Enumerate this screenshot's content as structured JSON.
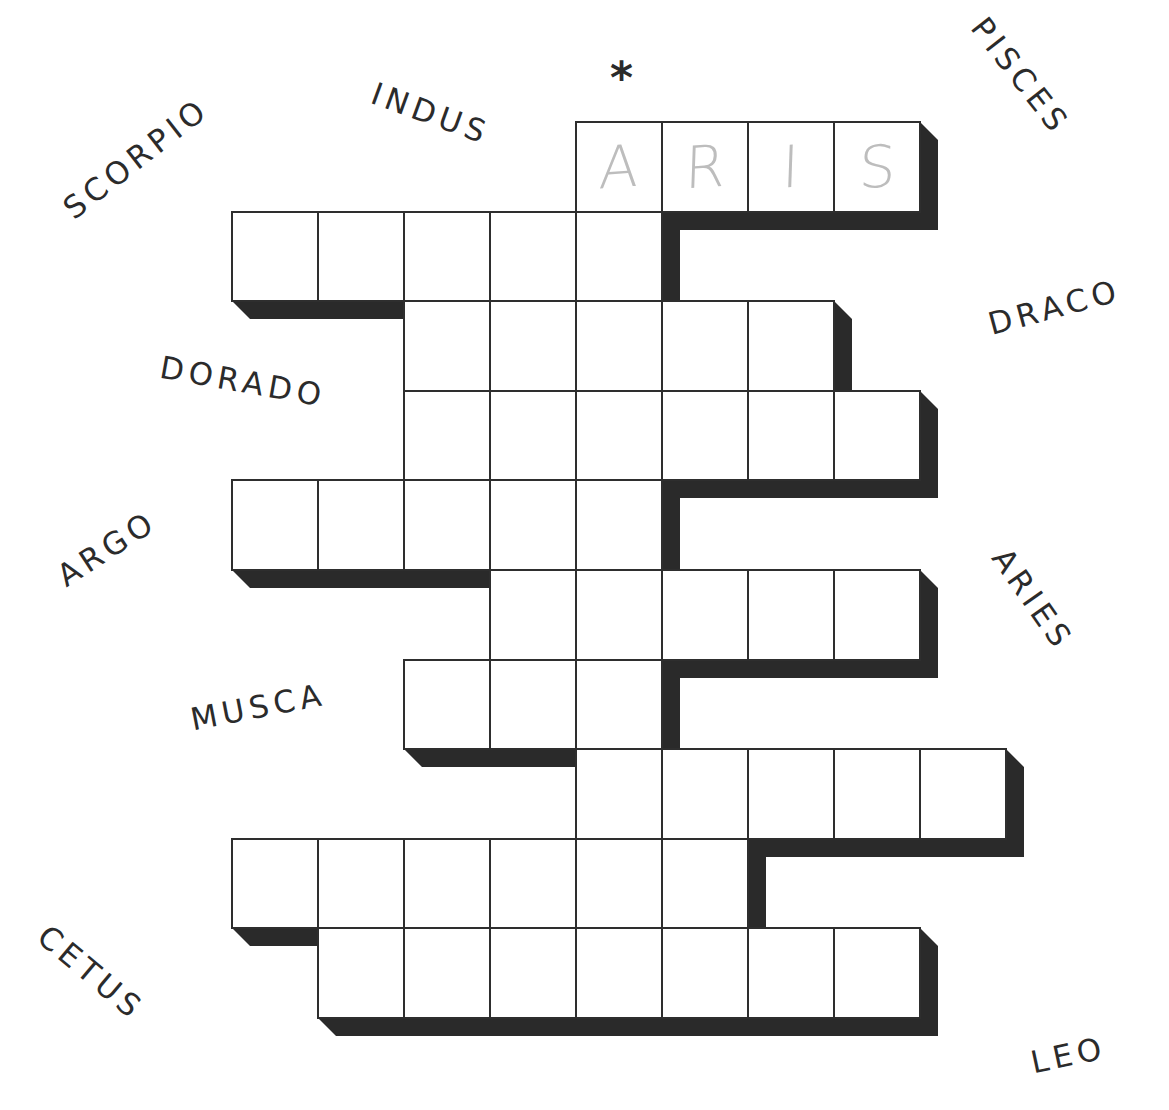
{
  "puzzle": {
    "marker": "*",
    "marker_column": 4,
    "colors": {
      "cell_fill": "#ffffff",
      "cell_border": "#2e2e2e",
      "shadow": "#2a2a2a",
      "label_text": "#2b2b2b",
      "pencil": "#bdbdbd"
    },
    "grid": {
      "origin_x": 232,
      "origin_y": 122,
      "col_pitch": 86,
      "row_pitch": 89.6,
      "shadow_depth": 18,
      "rows": [
        {
          "row": 0,
          "start_col": 4,
          "end_col": 7,
          "letters": [
            "A",
            "R",
            "I",
            "S"
          ]
        },
        {
          "row": 1,
          "start_col": 0,
          "end_col": 4,
          "letters": [
            "",
            "",
            "",
            "",
            ""
          ]
        },
        {
          "row": 2,
          "start_col": 2,
          "end_col": 6,
          "letters": [
            "",
            "",
            "",
            "",
            ""
          ]
        },
        {
          "row": 3,
          "start_col": 2,
          "end_col": 7,
          "letters": [
            "",
            "",
            "",
            "",
            "",
            ""
          ]
        },
        {
          "row": 4,
          "start_col": 0,
          "end_col": 4,
          "letters": [
            "",
            "",
            "",
            "",
            ""
          ]
        },
        {
          "row": 5,
          "start_col": 3,
          "end_col": 7,
          "letters": [
            "",
            "",
            "",
            "",
            ""
          ]
        },
        {
          "row": 6,
          "start_col": 2,
          "end_col": 4,
          "letters": [
            "",
            "",
            ""
          ]
        },
        {
          "row": 7,
          "start_col": 4,
          "end_col": 8,
          "letters": [
            "",
            "",
            "",
            "",
            ""
          ]
        },
        {
          "row": 8,
          "start_col": 0,
          "end_col": 5,
          "letters": [
            "",
            "",
            "",
            "",
            "",
            ""
          ]
        },
        {
          "row": 9,
          "start_col": 1,
          "end_col": 7,
          "letters": [
            "",
            "",
            "",
            "",
            "",
            "",
            ""
          ]
        }
      ]
    },
    "labels": [
      {
        "text": "SCORPIO",
        "x": 58,
        "y": 200,
        "rotate": -38
      },
      {
        "text": "INDUS",
        "x": 378,
        "y": 78,
        "rotate": 20
      },
      {
        "text": "PISCES",
        "x": 990,
        "y": 12,
        "rotate": 52
      },
      {
        "text": "DRACO",
        "x": 985,
        "y": 310,
        "rotate": -15
      },
      {
        "text": "DORADO",
        "x": 163,
        "y": 352,
        "rotate": 10
      },
      {
        "text": "ARGO",
        "x": 52,
        "y": 566,
        "rotate": -33
      },
      {
        "text": "ARIES",
        "x": 1012,
        "y": 543,
        "rotate": 55
      },
      {
        "text": "MUSCA",
        "x": 188,
        "y": 705,
        "rotate": -11
      },
      {
        "text": "CETUS",
        "x": 52,
        "y": 920,
        "rotate": 40
      },
      {
        "text": "LEO",
        "x": 1028,
        "y": 1048,
        "rotate": -12
      }
    ]
  }
}
